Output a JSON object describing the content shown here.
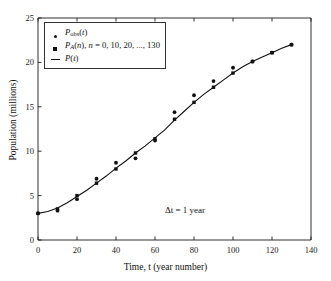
{
  "chart_data": {
    "type": "scatter",
    "title": "",
    "xlabel": "Time, t (year number)",
    "ylabel": "Population (millions)",
    "xlim": [
      0,
      140
    ],
    "ylim": [
      0,
      25
    ],
    "xticks": [
      0,
      20,
      40,
      60,
      80,
      100,
      120,
      140
    ],
    "yticks": [
      0,
      5,
      10,
      15,
      20,
      25
    ],
    "grid": false,
    "legend_position": "upper-left-inside",
    "annotations": [
      {
        "text": "Δt = 1 year",
        "x": 88,
        "y": 4.0
      }
    ],
    "series": [
      {
        "name": "P_obs(t)",
        "marker": "circle",
        "x": [
          0,
          10,
          20,
          30,
          40,
          50,
          60,
          70,
          80,
          90,
          100,
          110,
          120,
          130
        ],
        "values": [
          3.0,
          3.3,
          4.6,
          6.9,
          8.7,
          9.2,
          11.2,
          14.4,
          16.3,
          17.9,
          19.4,
          20.1,
          21.1,
          22.0
        ]
      },
      {
        "name": "P_A(n)",
        "marker": "square",
        "x": [
          0,
          10,
          20,
          30,
          40,
          50,
          60,
          70,
          80,
          90,
          100,
          110,
          120,
          130
        ],
        "values": [
          3.0,
          3.5,
          5.0,
          6.4,
          8.0,
          9.8,
          11.4,
          13.6,
          15.5,
          17.2,
          18.8,
          20.1,
          21.1,
          22.0
        ]
      },
      {
        "name": "P(t)",
        "marker": "line",
        "x": [
          0,
          5,
          10,
          15,
          20,
          25,
          30,
          35,
          40,
          45,
          50,
          55,
          60,
          65,
          70,
          75,
          80,
          85,
          90,
          95,
          100,
          105,
          110,
          115,
          120,
          125,
          130
        ],
        "values": [
          3.0,
          3.2,
          3.6,
          4.2,
          4.9,
          5.6,
          6.4,
          7.2,
          8.1,
          8.9,
          9.8,
          10.6,
          11.5,
          12.4,
          13.5,
          14.5,
          15.5,
          16.4,
          17.2,
          18.0,
          18.8,
          19.5,
          20.1,
          20.6,
          21.1,
          21.6,
          22.0
        ]
      }
    ]
  },
  "legend": {
    "entries": [
      {
        "marker": "circle",
        "label_main": "P",
        "label_sub": "obs",
        "label_rest": "(t)",
        "text": "P_obs(t)"
      },
      {
        "marker": "square",
        "label_main": "P",
        "label_sub": "A",
        "label_rest": "(n), n = 0, 10, 20, ..., 130",
        "text": "P_A(n), n = 0, 10, 20, ..., 130"
      },
      {
        "marker": "line",
        "label_main": "P",
        "label_sub": "",
        "label_rest": "(t)",
        "text": "P(t)"
      }
    ]
  },
  "axes": {
    "x_label": "Time, t (year number)",
    "y_label": "Population (millions)",
    "x_tick_labels": [
      "0",
      "20",
      "40",
      "60",
      "80",
      "100",
      "120",
      "140"
    ],
    "y_tick_labels": [
      "0",
      "5",
      "10",
      "15",
      "20",
      "25"
    ]
  },
  "annotation": {
    "delta_t": "Δt = 1 year"
  },
  "colors": {
    "axis": "#1a1a1a",
    "marker": "#111111",
    "curve": "#111111",
    "background": "#ffffff"
  }
}
